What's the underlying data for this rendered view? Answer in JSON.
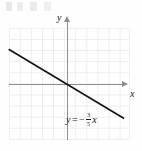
{
  "figure": {
    "name": "coordinate-plane-line-graph",
    "axes": {
      "x_label": "x",
      "y_label": "y"
    },
    "equation": {
      "lhs": "y",
      "equals": "=",
      "sign": "−",
      "numerator": "3",
      "denominator": "5",
      "variable": "x",
      "full_text": "y = −3/5 x"
    },
    "colors": {
      "line": "#141414",
      "axis": "#8d8d93",
      "grid": "#ededf0",
      "background": "#fefefe",
      "text": "#181818"
    }
  },
  "chart_data": {
    "type": "line",
    "title": "",
    "xlabel": "x",
    "ylabel": "y",
    "grid": true,
    "legend": "none",
    "annotations": [
      "y = −3/5 x"
    ],
    "xlim": [
      -5.3,
      5.1
    ],
    "ylim": [
      -5.1,
      5.1
    ],
    "series": [
      {
        "name": "y = -3/5 x",
        "slope": -0.6,
        "intercept": 0,
        "x": [
          -5.3,
          5.1
        ],
        "values": [
          3.18,
          -3.06
        ]
      }
    ]
  }
}
